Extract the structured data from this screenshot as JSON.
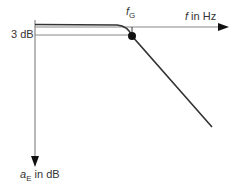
{
  "diagram": {
    "x_axis_label": {
      "var": "f",
      "rest": " in Hz"
    },
    "y_axis_label": {
      "var": "a",
      "sub": "E",
      "rest": " in dB"
    },
    "level_label": "3 dB",
    "cutoff_label": {
      "var": "f",
      "sub": "G"
    },
    "colors": {
      "axis": "#888888",
      "curve": "#333333",
      "point": "#111111"
    }
  }
}
